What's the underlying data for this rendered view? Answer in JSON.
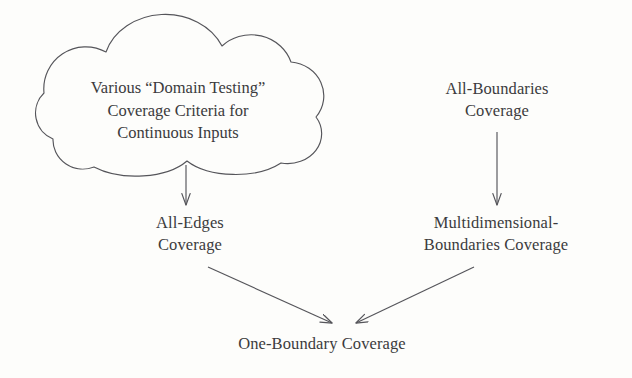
{
  "figure": {
    "background_color": "#fdfdfb",
    "ink_color": "#3b3b3d",
    "stroke_color": "#55555a"
  },
  "cloud": {
    "name": "domain-testing-cloud",
    "lines": [
      "Various “Domain Testing”",
      "Coverage Criteria for",
      "Continuous Inputs"
    ],
    "line1": "Various “Domain Testing”",
    "line2": "Coverage Criteria for",
    "line3": "Continuous Inputs"
  },
  "nodes": {
    "all_edges": {
      "line1": "All-Edges",
      "line2": "Coverage"
    },
    "all_boundaries": {
      "line1": "All-Boundaries",
      "line2": "Coverage"
    },
    "multidimensional_boundaries": {
      "line1": "Multidimensional-",
      "line2": "Boundaries Coverage"
    },
    "one_boundary": {
      "line1": "One-Boundary Coverage"
    }
  },
  "edges": [
    {
      "name": "cloud-to-all-edges",
      "from": "domain-testing-cloud",
      "to": "all-edges-coverage",
      "direction": "down"
    },
    {
      "name": "all-boundaries-to-multidimensional",
      "from": "all-boundaries-coverage",
      "to": "multidimensional-boundaries-coverage",
      "direction": "down"
    },
    {
      "name": "all-edges-to-one-boundary",
      "from": "all-edges-coverage",
      "to": "one-boundary-coverage",
      "direction": "down-right"
    },
    {
      "name": "multidimensional-to-one-boundary",
      "from": "multidimensional-boundaries-coverage",
      "to": "one-boundary-coverage",
      "direction": "down-left"
    }
  ]
}
